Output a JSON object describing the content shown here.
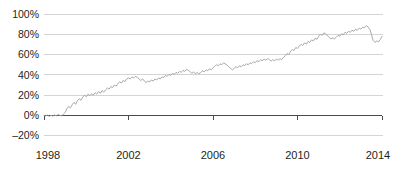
{
  "chart_data": {
    "type": "line",
    "title": "",
    "subtitle": "",
    "xlabel": "",
    "ylabel": "",
    "grid": true,
    "legend": false,
    "legend_position": "none",
    "line_color": "#a5a5a5",
    "axis_color": "#4a4a4a",
    "gridline_color": "#c9c9c9",
    "background_color": "#ffffff",
    "xlim": [
      1998,
      2014
    ],
    "ylim": [
      -20,
      100
    ],
    "y_ticks": [
      100,
      80,
      60,
      40,
      20,
      0,
      -20
    ],
    "y_tick_labels": [
      "100%",
      "80%",
      "60%",
      "40%",
      "20%",
      "0%",
      "‒20%"
    ],
    "x_ticks": [
      1998,
      2002,
      2006,
      2010,
      2014
    ],
    "x_tick_labels": [
      "1998",
      "2002",
      "2006",
      "2010",
      "2014"
    ],
    "series": [
      {
        "name": "cumulative-return",
        "x": [
          1998.0,
          1998.08,
          1998.17,
          1998.25,
          1998.33,
          1998.42,
          1998.5,
          1998.58,
          1998.67,
          1998.75,
          1998.83,
          1998.92,
          1999.0,
          1999.08,
          1999.17,
          1999.25,
          1999.33,
          1999.42,
          1999.5,
          1999.58,
          1999.67,
          1999.75,
          1999.83,
          1999.92,
          2000.0,
          2000.08,
          2000.17,
          2000.25,
          2000.33,
          2000.42,
          2000.5,
          2000.58,
          2000.67,
          2000.75,
          2000.83,
          2000.92,
          2001.0,
          2001.08,
          2001.17,
          2001.25,
          2001.33,
          2001.42,
          2001.5,
          2001.58,
          2001.67,
          2001.75,
          2001.83,
          2001.92,
          2002.0,
          2002.08,
          2002.17,
          2002.25,
          2002.33,
          2002.42,
          2002.5,
          2002.58,
          2002.67,
          2002.75,
          2002.83,
          2002.92,
          2003.0,
          2003.08,
          2003.17,
          2003.25,
          2003.33,
          2003.42,
          2003.5,
          2003.58,
          2003.67,
          2003.75,
          2003.83,
          2003.92,
          2004.0,
          2004.08,
          2004.17,
          2004.25,
          2004.33,
          2004.42,
          2004.5,
          2004.58,
          2004.67,
          2004.75,
          2004.83,
          2004.92,
          2005.0,
          2005.08,
          2005.17,
          2005.25,
          2005.33,
          2005.42,
          2005.5,
          2005.58,
          2005.67,
          2005.75,
          2005.83,
          2005.92,
          2006.0,
          2006.08,
          2006.17,
          2006.25,
          2006.33,
          2006.42,
          2006.5,
          2006.58,
          2006.67,
          2006.75,
          2006.83,
          2006.92,
          2007.0,
          2007.08,
          2007.17,
          2007.25,
          2007.33,
          2007.42,
          2007.5,
          2007.58,
          2007.67,
          2007.75,
          2007.83,
          2007.92,
          2008.0,
          2008.08,
          2008.17,
          2008.25,
          2008.33,
          2008.42,
          2008.5,
          2008.58,
          2008.67,
          2008.75,
          2008.83,
          2008.92,
          2009.0,
          2009.08,
          2009.17,
          2009.25,
          2009.33,
          2009.42,
          2009.5,
          2009.58,
          2009.67,
          2009.75,
          2009.83,
          2009.92,
          2010.0,
          2010.08,
          2010.17,
          2010.25,
          2010.33,
          2010.42,
          2010.5,
          2010.58,
          2010.67,
          2010.75,
          2010.83,
          2010.92,
          2011.0,
          2011.08,
          2011.17,
          2011.25,
          2011.33,
          2011.42,
          2011.5,
          2011.58,
          2011.67,
          2011.75,
          2011.83,
          2011.92,
          2012.0,
          2012.08,
          2012.17,
          2012.25,
          2012.33,
          2012.42,
          2012.5,
          2012.58,
          2012.67,
          2012.75,
          2012.83,
          2012.92,
          2013.0,
          2013.08,
          2013.17,
          2013.25,
          2013.33,
          2013.42,
          2013.5,
          2013.58,
          2013.67,
          2013.75,
          2013.83,
          2013.92,
          2014.0
        ],
        "values": [
          0.0,
          -0.6,
          0.4,
          -1.0,
          0.2,
          -0.8,
          0.6,
          -0.4,
          1.0,
          0.2,
          -0.5,
          1.5,
          3.0,
          6.5,
          9.0,
          7.5,
          10.5,
          13.0,
          11.0,
          14.5,
          16.5,
          15.0,
          18.0,
          20.0,
          18.5,
          21.0,
          19.5,
          21.5,
          20.0,
          22.5,
          21.0,
          23.5,
          22.0,
          24.5,
          23.0,
          25.5,
          27.0,
          26.0,
          28.5,
          27.5,
          30.0,
          29.0,
          31.5,
          33.0,
          32.0,
          34.5,
          33.5,
          36.0,
          37.0,
          36.0,
          38.0,
          37.0,
          38.5,
          37.5,
          36.0,
          34.5,
          36.0,
          34.0,
          32.5,
          34.0,
          33.0,
          35.0,
          34.0,
          36.0,
          35.0,
          37.0,
          36.0,
          38.0,
          37.5,
          39.5,
          38.5,
          40.5,
          39.5,
          41.5,
          40.5,
          42.5,
          41.5,
          43.5,
          42.5,
          44.5,
          43.5,
          45.5,
          44.5,
          43.0,
          41.5,
          43.0,
          41.0,
          42.5,
          41.0,
          42.5,
          44.0,
          43.0,
          45.0,
          44.0,
          46.0,
          45.0,
          47.0,
          48.5,
          50.0,
          49.0,
          51.0,
          50.0,
          52.0,
          51.0,
          49.5,
          48.0,
          46.5,
          45.0,
          46.5,
          48.0,
          47.0,
          49.0,
          48.0,
          50.0,
          49.0,
          51.0,
          50.0,
          52.0,
          51.0,
          53.0,
          52.0,
          54.0,
          53.0,
          55.0,
          54.0,
          55.5,
          54.5,
          56.0,
          55.0,
          53.5,
          55.0,
          54.0,
          55.5,
          54.5,
          56.0,
          55.0,
          57.0,
          59.0,
          61.0,
          60.0,
          63.0,
          65.0,
          64.0,
          67.0,
          66.0,
          68.5,
          70.0,
          69.0,
          71.5,
          70.5,
          73.0,
          72.0,
          74.5,
          73.5,
          76.0,
          75.0,
          78.0,
          80.0,
          79.0,
          81.5,
          80.5,
          78.5,
          77.0,
          75.5,
          76.5,
          75.5,
          77.0,
          79.0,
          78.0,
          80.5,
          79.5,
          82.0,
          81.0,
          83.0,
          82.0,
          84.0,
          83.0,
          85.0,
          84.0,
          86.0,
          85.0,
          87.0,
          86.5,
          88.5,
          87.5,
          85.0,
          80.0,
          74.0,
          72.0,
          73.5,
          72.5,
          75.0,
          78.0
        ]
      }
    ]
  },
  "axis": {
    "y_labels": [
      "100%",
      "80%",
      "60%",
      "40%",
      "20%",
      "0%",
      "‒20%"
    ],
    "x_labels": [
      "1998",
      "2002",
      "2006",
      "2010",
      "2014"
    ]
  }
}
